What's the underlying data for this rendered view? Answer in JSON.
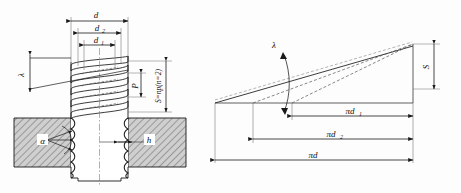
{
  "figure": {
    "panels": [
      {
        "name": "bolt-section-view",
        "description": "Threaded bolt in sectioned plate, with helical thread coils above"
      },
      {
        "name": "unwrapped-helix-view",
        "description": "Developed helix triangle showing lead S over circumferences"
      }
    ]
  },
  "left_panel": {
    "dimensions": {
      "major_diameter": "d",
      "pitch_diameter": "d",
      "pitch_diameter_sub": "2",
      "minor_diameter": "d",
      "minor_diameter_sub": "1",
      "pitch": "P",
      "lead": "S=np(n=2)",
      "helix_angle": "λ",
      "thread_angle": "α",
      "thread_depth": "h"
    }
  },
  "right_panel": {
    "labels": {
      "lead": "S",
      "helix_angle": "λ",
      "circumference_minor": "πd",
      "circumference_minor_sub": "1",
      "circumference_pitch": "πd",
      "circumference_pitch_sub": "2",
      "circumference_major": "πd"
    }
  },
  "colors": {
    "line": "#1a1a1a",
    "hatch": "#6e6e6e",
    "hatch_fill": "#c9c9c9",
    "dash": "#555555",
    "background": "#fdfdfd"
  }
}
